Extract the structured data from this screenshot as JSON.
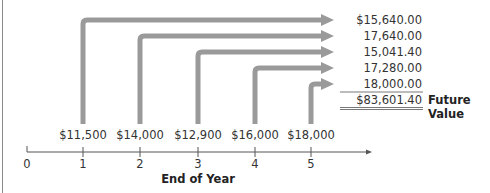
{
  "diagram": {
    "axis": {
      "title": "End of Year",
      "ticks": [
        "0",
        "1",
        "2",
        "3",
        "4",
        "5"
      ]
    },
    "cash_flows": [
      "$11,500",
      "$14,000",
      "$12,900",
      "$16,000",
      "$18,000"
    ],
    "future_values": [
      "$15,640.00",
      "17,640.00",
      "15,041.40",
      "17,280.00",
      "18,000.00"
    ],
    "total": "$83,601.40",
    "total_label": "Future Value",
    "colors": {
      "arrow": "#9a9a9a",
      "axis": "#555555",
      "text": "#333333"
    }
  }
}
